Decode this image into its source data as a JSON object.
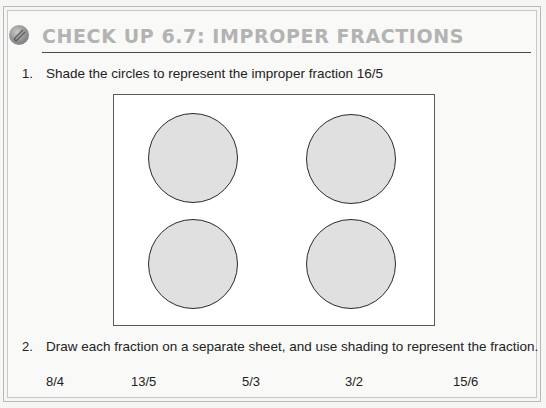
{
  "header": {
    "icon": "pencil-badge-icon",
    "title": "CHECK UP 6.7: IMPROPER FRACTIONS"
  },
  "questions": [
    {
      "number": "1.",
      "text": "Shade the circles to represent the improper fraction 16/5",
      "diagram": {
        "circles": 4,
        "layout": "2x2",
        "fill": "#e0e0e0"
      }
    },
    {
      "number": "2.",
      "text": "Draw each fraction on a separate sheet, and use shading to represent the fraction.",
      "fractions": [
        "8/4",
        "13/5",
        "5/3",
        "3/2",
        "15/6"
      ]
    }
  ],
  "colors": {
    "title": "#b3b3b3",
    "rule": "#4a4a4a",
    "circle_fill": "#e0e0e0",
    "circle_stroke": "#2a2a2a"
  }
}
